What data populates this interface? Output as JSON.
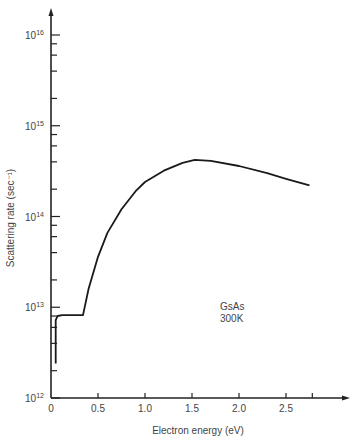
{
  "chart_data": {
    "type": "line",
    "title": "",
    "xlabel": "Electron energy (eV)",
    "ylabel": "Scattering rate (sec⁻¹)",
    "xscale": "linear",
    "yscale": "log",
    "xlim": [
      0,
      3.0
    ],
    "ylim": [
      1000000000000.0,
      1e+16
    ],
    "x_ticks": [
      "0",
      "0.5",
      "1.0",
      "1.5",
      "2.0",
      "2.5"
    ],
    "y_ticks": [
      {
        "base": "10",
        "exp": "12"
      },
      {
        "base": "10",
        "exp": "13"
      },
      {
        "base": "10",
        "exp": "14"
      },
      {
        "base": "10",
        "exp": "15"
      },
      {
        "base": "10",
        "exp": "16"
      }
    ],
    "grid": false,
    "annotation": {
      "line1": "GsAs",
      "line2": "300K"
    },
    "series": [
      {
        "name": "GaAs 300K total scattering rate",
        "x": [
          0.05,
          0.05,
          0.07,
          0.12,
          0.34,
          0.4,
          0.5,
          0.6,
          0.75,
          0.9,
          1.0,
          1.2,
          1.4,
          1.53,
          1.7,
          2.0,
          2.3,
          2.5,
          2.75
        ],
        "y": [
          2400000000000.0,
          7200000000000.0,
          8000000000000.0,
          8200000000000.0,
          8200000000000.0,
          16000000000000.0,
          36000000000000.0,
          66000000000000.0,
          120000000000000.0,
          190000000000000.0,
          240000000000000.0,
          320000000000000.0,
          390000000000000.0,
          420000000000000.0,
          410000000000000.0,
          360000000000000.0,
          300000000000000.0,
          260000000000000.0,
          220000000000000.0
        ]
      }
    ]
  }
}
